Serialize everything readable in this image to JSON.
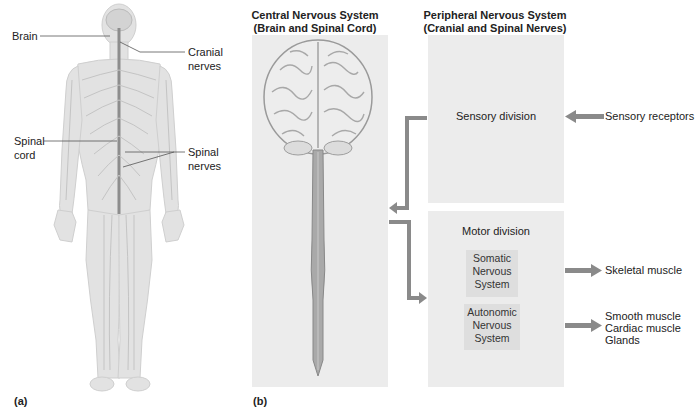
{
  "panel_a": {
    "caption": "(a)",
    "labels": {
      "brain": "Brain",
      "cranial_nerves_1": "Cranial",
      "cranial_nerves_2": "nerves",
      "spinal_cord_1": "Spinal",
      "spinal_cord_2": "cord",
      "spinal_nerves_1": "Spinal",
      "spinal_nerves_2": "nerves"
    }
  },
  "panel_b": {
    "caption": "(b)",
    "cns": {
      "title_1": "Central Nervous System",
      "title_2": "(Brain and Spinal Cord)"
    },
    "pns": {
      "title_1": "Peripheral Nervous System",
      "title_2": "(Cranial and Spinal Nerves)",
      "sensory_division": "Sensory division",
      "motor_division": "Motor division",
      "somatic": [
        "Somatic",
        "Nervous",
        "System"
      ],
      "autonomic": [
        "Autonomic",
        "Nervous",
        "System"
      ]
    },
    "inputs": {
      "sensory_receptors": "Sensory receptors"
    },
    "outputs": {
      "skeletal_muscle": "Skeletal muscle",
      "autonomic_targets": [
        "Smooth muscle",
        "Cardiac muscle",
        "Glands"
      ]
    },
    "colors": {
      "arrow": "#8a8a8a",
      "panel": "#ececec",
      "subbox": "#dedede"
    }
  }
}
